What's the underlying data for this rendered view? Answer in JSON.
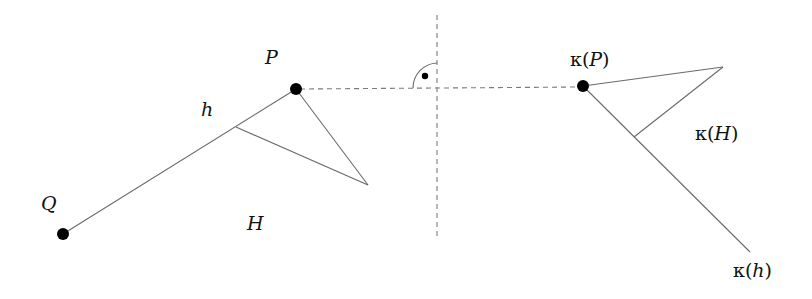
{
  "diagram": {
    "left": {
      "point_P": {
        "label": "P",
        "x": 296,
        "y": 89
      },
      "point_Q": {
        "label": "Q",
        "x": 63,
        "y": 234
      },
      "line_h": {
        "label": "h"
      },
      "halfplane_H": {
        "label": "H"
      }
    },
    "right": {
      "point_kP": {
        "label_prefix": "κ",
        "label_arg": "P",
        "x": 583,
        "y": 86
      },
      "line_kh": {
        "label_prefix": "κ",
        "label_arg": "h"
      },
      "halfplane_kH": {
        "label_prefix": "κ",
        "label_arg": "H"
      }
    },
    "mirror_axis": {
      "style": "dashed",
      "x": 437
    },
    "connector": {
      "style": "dashed",
      "from": "P",
      "to": "κ(P)"
    },
    "right_angle_mark": {
      "type": "arc-with-dot"
    }
  },
  "labels": {
    "P": "P",
    "Q": "Q",
    "h": "h",
    "H": "H",
    "kappa": "κ",
    "open": "(",
    "close": ")"
  }
}
